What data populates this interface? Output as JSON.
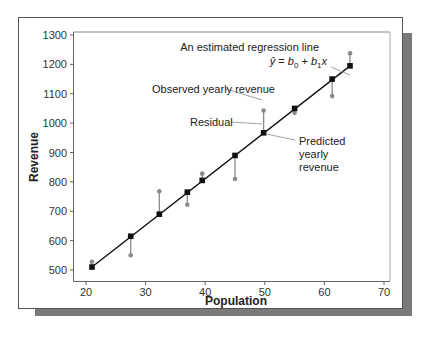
{
  "chart_data": {
    "type": "scatter",
    "title": "",
    "xlabel": "Population",
    "ylabel": "Revenue",
    "xlim": [
      20,
      70
    ],
    "ylim": [
      500,
      1300
    ],
    "xticks": [
      20,
      30,
      40,
      50,
      60,
      70
    ],
    "yticks": [
      500,
      600,
      700,
      800,
      900,
      1000,
      1100,
      1200,
      1300
    ],
    "grid": false,
    "legend": null,
    "regression_line": {
      "x_start": 21,
      "y_start": 510,
      "x_end": 64.3,
      "y_end": 1195
    },
    "series": [
      {
        "name": "Predicted yearly revenue",
        "marker": "square",
        "color": "#111111",
        "points": [
          {
            "x": 21.0,
            "y": 510
          },
          {
            "x": 27.5,
            "y": 615
          },
          {
            "x": 32.3,
            "y": 690
          },
          {
            "x": 37.0,
            "y": 765
          },
          {
            "x": 39.5,
            "y": 805
          },
          {
            "x": 45.0,
            "y": 890
          },
          {
            "x": 49.8,
            "y": 967
          },
          {
            "x": 55.0,
            "y": 1050
          },
          {
            "x": 61.3,
            "y": 1150
          },
          {
            "x": 64.3,
            "y": 1195
          }
        ]
      },
      {
        "name": "Observed yearly revenue",
        "marker": "circle",
        "color": "#8a8a8a",
        "points": [
          {
            "x": 21.0,
            "y": 528
          },
          {
            "x": 27.5,
            "y": 550
          },
          {
            "x": 32.3,
            "y": 768
          },
          {
            "x": 37.0,
            "y": 722
          },
          {
            "x": 39.5,
            "y": 828
          },
          {
            "x": 45.0,
            "y": 810
          },
          {
            "x": 49.8,
            "y": 1043
          },
          {
            "x": 55.0,
            "y": 1035
          },
          {
            "x": 61.3,
            "y": 1092
          },
          {
            "x": 64.3,
            "y": 1238
          }
        ]
      }
    ],
    "annotations": [
      {
        "id": "regression",
        "lines": [
          "An estimated regression line"
        ],
        "equation": "ŷ = b₀ + b₁x",
        "points_to": {
          "x": 64.3,
          "y": 1195
        }
      },
      {
        "id": "observed",
        "lines": [
          "Observed yearly revenue"
        ],
        "points_to": {
          "x": 49.8,
          "y": 1043
        }
      },
      {
        "id": "residual",
        "lines": [
          "Residual"
        ],
        "points_to": {
          "x": 49.8,
          "y": 1005
        }
      },
      {
        "id": "predicted",
        "lines": [
          "Predicted",
          "yearly",
          "revenue"
        ],
        "points_to": {
          "x": 49.8,
          "y": 967
        }
      }
    ]
  },
  "labels": {
    "xlabel": "Population",
    "ylabel": "Revenue",
    "regression_title": "An estimated regression line",
    "eq_yhat": "ŷ",
    "eq_eq": " = ",
    "eq_b": "b",
    "eq_0": "0",
    "eq_plus": " + ",
    "eq_1": "1",
    "eq_x": "x",
    "observed": "Observed yearly revenue",
    "residual": "Residual",
    "predicted_1": "Predicted",
    "predicted_2": "yearly",
    "predicted_3": "revenue"
  },
  "colors": {
    "frame": "#555555",
    "shadow": "#777777",
    "axis": "#666666",
    "line": "#111111",
    "observed": "#8a8a8a",
    "residual": "#8a8a8a",
    "leader": "#9a9a9a"
  }
}
